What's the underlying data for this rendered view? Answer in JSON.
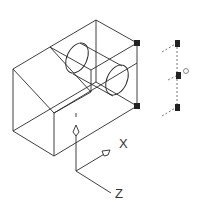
{
  "viewport": {
    "name": "3D wireframe model view",
    "background": "#ffffff",
    "line_color": "#222222"
  },
  "ucs_icon": {
    "x_label": "X",
    "y_label": "Y",
    "z_label": "Z"
  },
  "model": {
    "type": "wireframe block with sloped face and cylindrical boss",
    "grips": [
      {
        "name": "grip-top-right",
        "x": 137,
        "y": 43
      },
      {
        "name": "grip-bottom-right",
        "x": 137,
        "y": 106
      }
    ]
  },
  "gizmo": {
    "name": "move-gizmo",
    "grips": [
      {
        "name": "gizmo-grip-top",
        "x": 177,
        "y": 43
      },
      {
        "name": "gizmo-grip-mid",
        "x": 178,
        "y": 75
      },
      {
        "name": "gizmo-grip-bottom",
        "x": 177,
        "y": 107
      }
    ]
  }
}
